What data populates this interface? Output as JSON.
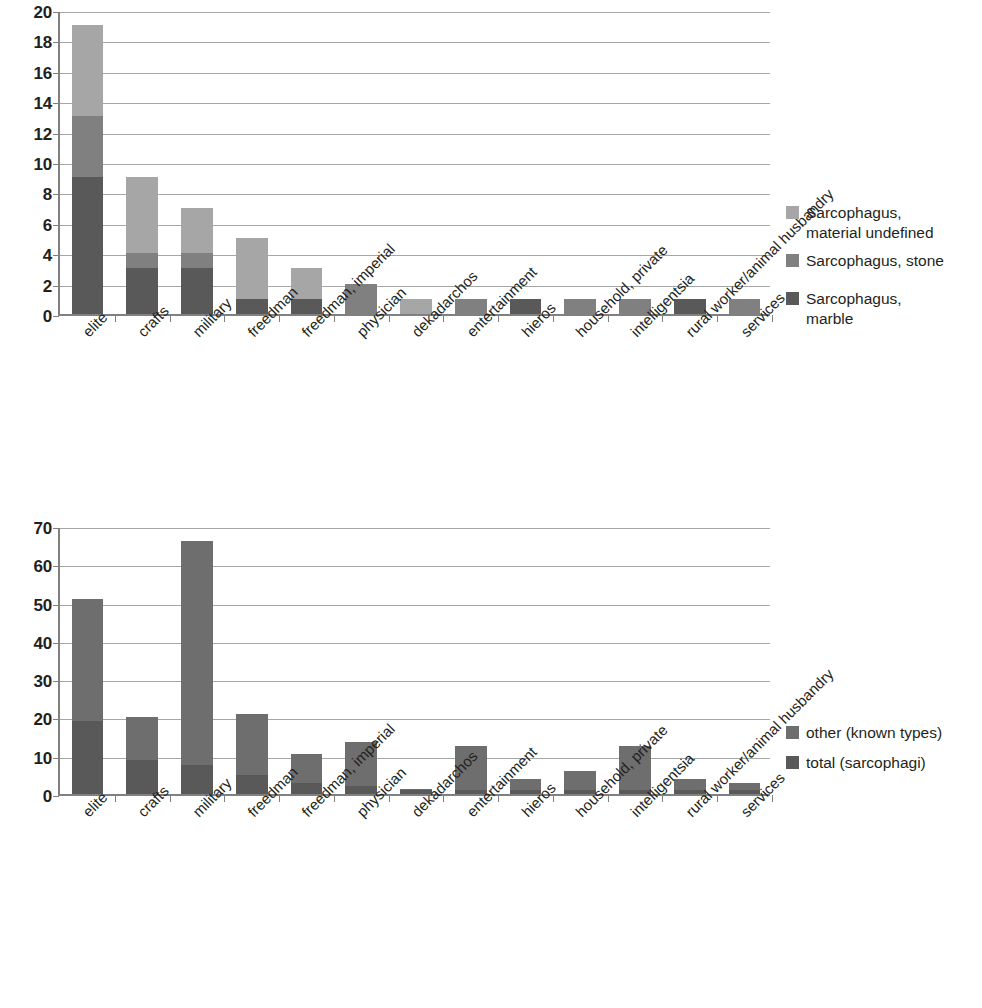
{
  "chart_data": [
    {
      "id": "sarcophagus-types-by-occupation",
      "type": "bar",
      "stacked": true,
      "title": "",
      "xlabel": "",
      "ylabel": "",
      "ylim": [
        0,
        20
      ],
      "yticks": [
        0,
        2,
        4,
        6,
        8,
        10,
        12,
        14,
        16,
        18,
        20
      ],
      "grid": true,
      "legend_position": "right",
      "categories": [
        "elite",
        "crafts",
        "military",
        "freedman",
        "freedman, imperial",
        "physician",
        "dekadarchos",
        "entertainment",
        "hieros",
        "household, private",
        "intelligentsia",
        "rural worker/animal husbandry",
        "services"
      ],
      "series": [
        {
          "name": "Sarcophagus,\nmarble",
          "color": "#595959",
          "values": [
            9,
            3,
            3,
            1,
            1,
            0,
            0,
            0,
            1,
            0,
            0,
            1,
            0
          ]
        },
        {
          "name": "Sarcophagus, stone",
          "color": "#808080",
          "values": [
            4,
            1,
            1,
            0,
            0,
            2,
            0,
            1,
            0,
            1,
            1,
            0,
            1
          ]
        },
        {
          "name": "Sarcophagus,\nmaterial undefined",
          "color": "#a6a6a6",
          "values": [
            6,
            5,
            3,
            4,
            2,
            0,
            1,
            0,
            0,
            0,
            0,
            0,
            0
          ]
        }
      ],
      "totals": [
        19,
        9,
        7,
        5,
        3,
        2,
        1,
        1,
        1,
        1,
        1,
        1,
        1
      ]
    },
    {
      "id": "sarcophagi-vs-other-known-types",
      "type": "bar",
      "stacked": true,
      "title": "",
      "xlabel": "",
      "ylabel": "",
      "ylim": [
        0,
        70
      ],
      "yticks": [
        0,
        10,
        20,
        30,
        40,
        50,
        60,
        70
      ],
      "grid": true,
      "legend_position": "right",
      "categories": [
        "elite",
        "crafts",
        "military",
        "freedman",
        "freedman, imperial",
        "physician",
        "dekadarchos",
        "entertainment",
        "hieros",
        "household, private",
        "intelligentsia",
        "rural worker/animal husbandry",
        "services"
      ],
      "series": [
        {
          "name": "total (sarcophagi)",
          "color": "#595959",
          "values": [
            19,
            9,
            7.5,
            5,
            3,
            2,
            1,
            1,
            1,
            1,
            1,
            1,
            1
          ]
        },
        {
          "name": "other (known types)",
          "color": "#6e6e6e",
          "values": [
            32,
            11,
            58.5,
            16,
            7.5,
            11.5,
            0.3,
            11.5,
            3,
            5,
            11.5,
            3,
            2
          ]
        }
      ],
      "totals": [
        51,
        20,
        66,
        21,
        10.5,
        13.5,
        1.3,
        12.5,
        4,
        6,
        12.5,
        4,
        3
      ]
    }
  ],
  "chart1": {
    "legend": [
      {
        "label": "Sarcophagus,\nmaterial undefined",
        "color": "#a6a6a6"
      },
      {
        "label": "Sarcophagus, stone",
        "color": "#808080"
      },
      {
        "label": "Sarcophagus,\nmarble",
        "color": "#595959"
      }
    ]
  },
  "chart2": {
    "legend": [
      {
        "label": "other (known types)",
        "color": "#6e6e6e"
      },
      {
        "label": "total (sarcophagi)",
        "color": "#595959"
      }
    ]
  },
  "footer": {
    "smudge": ""
  }
}
